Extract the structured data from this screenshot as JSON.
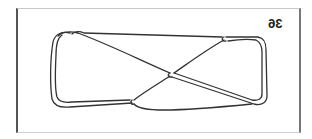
{
  "figure": {
    "label": "36",
    "label_mirrored": true,
    "stroke_color": "#333333",
    "crossings": [
      {
        "name": "center",
        "x": 172,
        "y": 75
      },
      {
        "name": "top-right",
        "x": 224,
        "y": 40
      },
      {
        "name": "bottom-left",
        "x": 132,
        "y": 104
      },
      {
        "name": "top-left",
        "x": 70,
        "y": 33
      }
    ]
  }
}
